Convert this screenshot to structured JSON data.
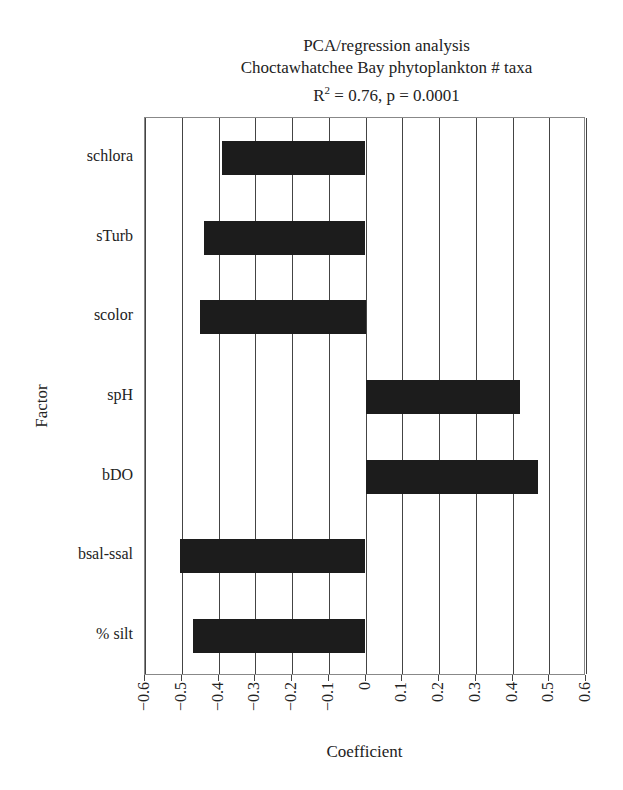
{
  "chart_data": {
    "type": "bar",
    "orientation": "horizontal",
    "title": "PCA/regression analysis",
    "subtitle": "Choctawhatchee Bay phytoplankton # taxa",
    "stats": "R² = 0.76, p = 0.0001",
    "xlabel": "Coefficient",
    "ylabel": "Factor",
    "categories": [
      "schlora",
      "sTurb",
      "scolor",
      "spH",
      "bDO",
      "bsal-ssal",
      "% silt"
    ],
    "values": [
      -0.39,
      -0.44,
      -0.45,
      0.42,
      0.47,
      -0.505,
      -0.47
    ],
    "xlim": [
      -0.6,
      0.6
    ],
    "xticks": [
      "−0.6",
      "−0.5",
      "−0.4",
      "−0.3",
      "−0.2",
      "−0.1",
      "0",
      "0.1",
      "0.2",
      "0.3",
      "0.4",
      "0.5",
      "0.6"
    ],
    "grid": true,
    "legend": null,
    "bar_color": "#1c1c1c"
  },
  "title": {
    "line1": "PCA/regression analysis",
    "line2": "Choctawhatchee Bay phytoplankton # taxa",
    "r2_prefix": "R",
    "r2_sup": "2",
    "r2_rest": " = 0.76, p = 0.0001"
  }
}
